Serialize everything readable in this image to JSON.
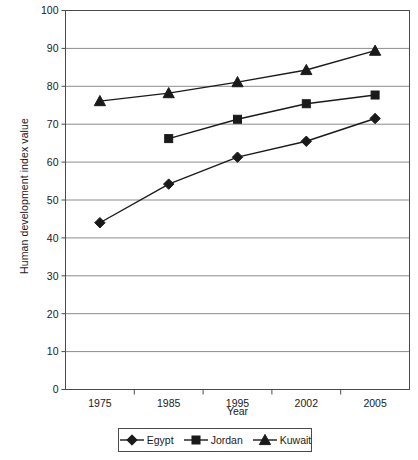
{
  "chart_data": {
    "type": "line",
    "title": "",
    "xlabel": "Year",
    "ylabel": "Human development index value",
    "categories": [
      "1975",
      "1985",
      "1995",
      "2002",
      "2005"
    ],
    "ylim": [
      0,
      100
    ],
    "yticks": [
      "0",
      "10",
      "20",
      "30",
      "40",
      "50",
      "60",
      "70",
      "80",
      "90",
      "100"
    ],
    "grid": "horizontal",
    "legend_position": "bottom-center",
    "series": [
      {
        "name": "Egypt",
        "marker": "diamond",
        "color": "#1a1a1a",
        "values": [
          44.0,
          54.2,
          61.3,
          65.5,
          71.5
        ]
      },
      {
        "name": "Jordan",
        "marker": "square",
        "color": "#1a1a1a",
        "values": [
          null,
          66.2,
          71.3,
          75.4,
          77.7
        ]
      },
      {
        "name": "Kuwait",
        "marker": "triangle",
        "color": "#1a1a1a",
        "values": [
          76.1,
          78.2,
          81.1,
          84.3,
          89.4
        ]
      }
    ]
  },
  "legend": {
    "items": [
      {
        "label": "Egypt",
        "marker": "diamond-marker-icon"
      },
      {
        "label": "Jordan",
        "marker": "square-marker-icon"
      },
      {
        "label": "Kuwait",
        "marker": "triangle-marker-icon"
      }
    ]
  },
  "colors": {
    "line": "#1a1a1a",
    "grid": "#8c8c8c",
    "axis": "#4a4a4a",
    "text": "#1a1a1a",
    "background": "#ffffff"
  }
}
